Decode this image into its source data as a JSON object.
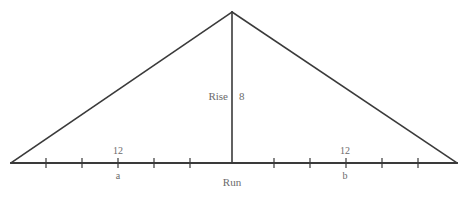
{
  "diagram": {
    "colors": {
      "stroke": "#3a3a3a",
      "label_text": "#6b6b6b",
      "background": "#ffffff"
    },
    "geometry": {
      "left_vertex": {
        "x": 11,
        "y": 163
      },
      "right_vertex": {
        "x": 457,
        "y": 163
      },
      "apex": {
        "x": 232,
        "y": 12
      },
      "baseline_y": 163,
      "tick_half_height": 5,
      "tick_spacing": 36,
      "tick_positions_x": [
        46,
        82,
        118,
        154,
        190,
        274,
        310,
        346,
        382,
        418
      ],
      "stroke_width": 1.6
    },
    "labels": {
      "rise": "Rise",
      "rise_value": "8",
      "run": "Run",
      "segment_a_value": "12",
      "segment_a_name": "a",
      "segment_b_value": "12",
      "segment_b_name": "b"
    }
  }
}
